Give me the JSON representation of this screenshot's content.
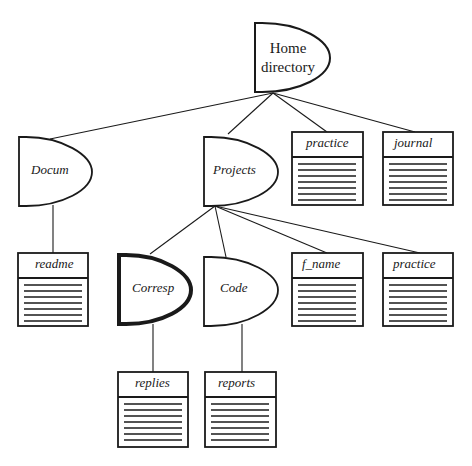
{
  "diagram": {
    "type": "directory-tree",
    "colors": {
      "stroke": "#1a1a1a",
      "background": "#ffffff"
    },
    "nodes": {
      "home": {
        "label_line1": "Home",
        "label_line2": "directory",
        "kind": "directory"
      },
      "docum": {
        "label": "Docum",
        "kind": "directory",
        "parent": "home"
      },
      "projects": {
        "label": "Projects",
        "kind": "directory",
        "parent": "home"
      },
      "practice_top": {
        "label": "practice",
        "kind": "file",
        "parent": "home"
      },
      "journal": {
        "label": "journal",
        "kind": "file",
        "parent": "home"
      },
      "readme": {
        "label": "readme",
        "kind": "file",
        "parent": "docum"
      },
      "corresp": {
        "label": "Corresp",
        "kind": "directory",
        "parent": "projects",
        "highlighted": true
      },
      "code": {
        "label": "Code",
        "kind": "directory",
        "parent": "projects"
      },
      "f_name": {
        "label": "f_name",
        "kind": "file",
        "parent": "projects"
      },
      "practice_proj": {
        "label": "practice",
        "kind": "file",
        "parent": "projects"
      },
      "replies": {
        "label": "replies",
        "kind": "file",
        "parent": "corresp"
      },
      "reports": {
        "label": "reports",
        "kind": "file",
        "parent": "code"
      }
    }
  }
}
